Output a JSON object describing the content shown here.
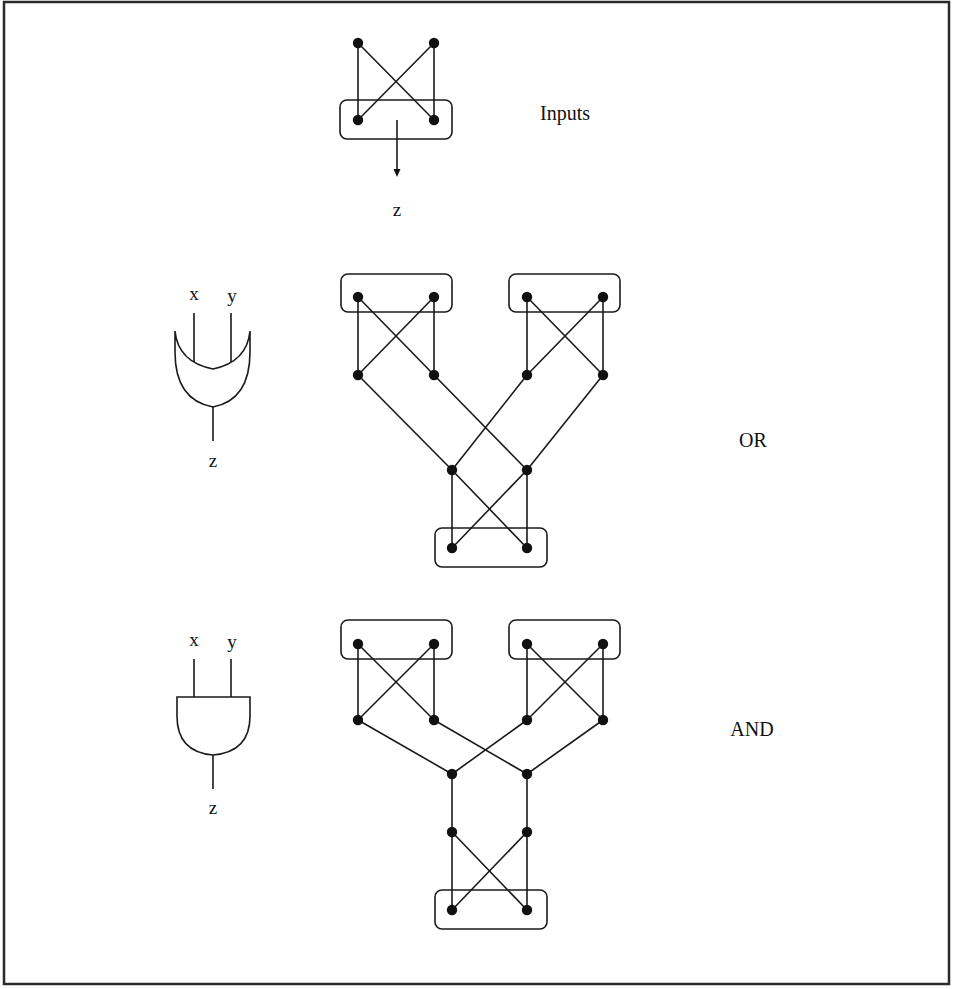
{
  "figure": {
    "background": "#ffffff",
    "ink": "#111111",
    "frame": {
      "x": 4,
      "y": 2,
      "w": 945,
      "h": 982
    }
  },
  "labels": {
    "inputs": "Inputs",
    "inputs_output": "z",
    "or": "OR",
    "and": "AND",
    "or_gate": {
      "x": "x",
      "y": "y",
      "z": "z"
    },
    "and_gate": {
      "x": "x",
      "y": "y",
      "z": "z"
    }
  },
  "graphs": {
    "inputs": {
      "nodes": [
        [
          358,
          43
        ],
        [
          434,
          43
        ],
        [
          358,
          120
        ],
        [
          434,
          120
        ]
      ],
      "edges": [
        [
          0,
          2
        ],
        [
          0,
          3
        ],
        [
          1,
          2
        ],
        [
          1,
          3
        ]
      ],
      "boxes": [
        {
          "x": 340,
          "y": 100,
          "w": 112,
          "h": 39
        }
      ],
      "arrow": {
        "from": [
          397,
          120
        ],
        "to": [
          397,
          177
        ]
      }
    },
    "or": {
      "nodes": [
        [
          358,
          297
        ],
        [
          434,
          297
        ],
        [
          527,
          297
        ],
        [
          603,
          297
        ],
        [
          358,
          375
        ],
        [
          434,
          375
        ],
        [
          527,
          375
        ],
        [
          603,
          375
        ],
        [
          452,
          470
        ],
        [
          527,
          470
        ],
        [
          452,
          548
        ],
        [
          527,
          548
        ]
      ],
      "edges": [
        [
          0,
          4
        ],
        [
          0,
          5
        ],
        [
          1,
          4
        ],
        [
          1,
          5
        ],
        [
          2,
          6
        ],
        [
          2,
          7
        ],
        [
          3,
          6
        ],
        [
          3,
          7
        ],
        [
          4,
          8
        ],
        [
          5,
          9
        ],
        [
          6,
          8
        ],
        [
          7,
          9
        ],
        [
          8,
          10
        ],
        [
          8,
          11
        ],
        [
          9,
          10
        ],
        [
          9,
          11
        ]
      ],
      "boxes": [
        {
          "x": 341,
          "y": 274,
          "w": 111,
          "h": 38
        },
        {
          "x": 509,
          "y": 274,
          "w": 111,
          "h": 38
        },
        {
          "x": 435,
          "y": 528,
          "w": 112,
          "h": 39
        }
      ]
    },
    "and": {
      "nodes": [
        [
          358,
          644
        ],
        [
          434,
          644
        ],
        [
          527,
          644
        ],
        [
          603,
          644
        ],
        [
          358,
          720
        ],
        [
          434,
          720
        ],
        [
          527,
          720
        ],
        [
          603,
          720
        ],
        [
          452,
          774
        ],
        [
          527,
          774
        ],
        [
          452,
          832
        ],
        [
          527,
          832
        ],
        [
          452,
          910
        ],
        [
          527,
          910
        ]
      ],
      "edges": [
        [
          0,
          4
        ],
        [
          0,
          5
        ],
        [
          1,
          4
        ],
        [
          1,
          5
        ],
        [
          2,
          6
        ],
        [
          2,
          7
        ],
        [
          3,
          6
        ],
        [
          3,
          7
        ],
        [
          4,
          8
        ],
        [
          5,
          9
        ],
        [
          6,
          8
        ],
        [
          7,
          9
        ],
        [
          8,
          10
        ],
        [
          9,
          11
        ],
        [
          10,
          12
        ],
        [
          10,
          13
        ],
        [
          11,
          12
        ],
        [
          11,
          13
        ]
      ],
      "boxes": [
        {
          "x": 341,
          "y": 620,
          "w": 111,
          "h": 39
        },
        {
          "x": 509,
          "y": 620,
          "w": 111,
          "h": 39
        },
        {
          "x": 435,
          "y": 890,
          "w": 112,
          "h": 39
        }
      ]
    }
  }
}
